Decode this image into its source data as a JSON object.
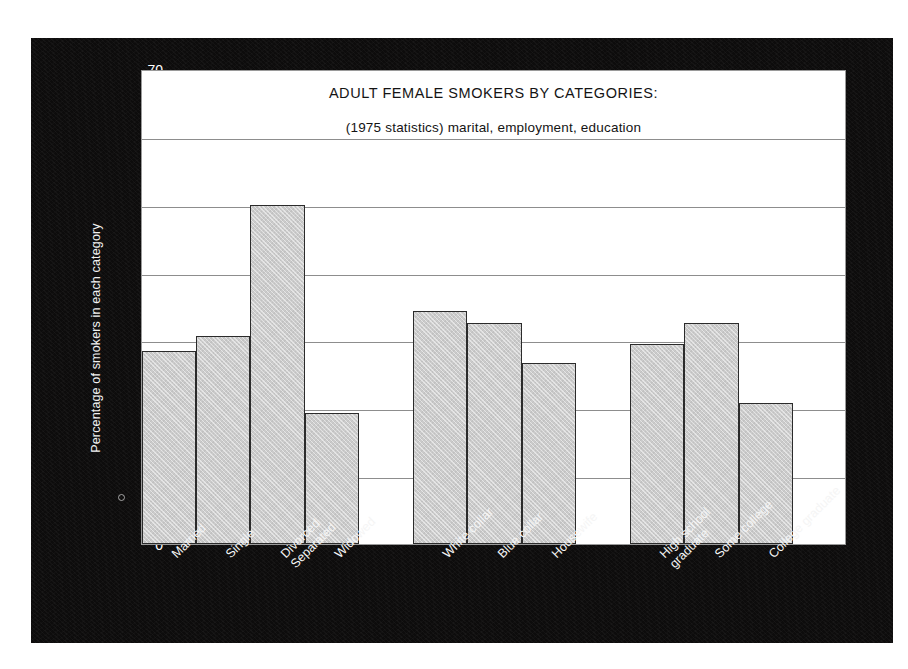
{
  "chart_data": {
    "type": "bar",
    "title": "ADULT FEMALE SMOKERS BY CATEGORIES:",
    "subtitle": "(1975 statistics) marital, employment, education",
    "xlabel": "",
    "ylabel": "Percentage of smokers in each category",
    "ylim": [
      0,
      70
    ],
    "ytick_labels": [
      "70",
      "60",
      "50",
      "40",
      "30",
      "20",
      "10",
      "0"
    ],
    "ytick_values": [
      70,
      60,
      50,
      40,
      30,
      20,
      10,
      0
    ],
    "grid": true,
    "legend": "none",
    "categories": [
      "Married",
      "Single",
      "Divorced Separated",
      "Widowed",
      "White collar",
      "Blue collar",
      "Housewife",
      "High school graduate",
      "Some college",
      "College graduate"
    ],
    "values": [
      28.5,
      30.7,
      50.0,
      19.3,
      34.4,
      32.5,
      26.7,
      29.5,
      32.5,
      20.8
    ],
    "groups": [
      {
        "name": "marital",
        "categories": [
          "Married",
          "Single",
          "Divorced Separated",
          "Widowed"
        ]
      },
      {
        "name": "employment",
        "categories": [
          "White collar",
          "Blue collar",
          "Housewife"
        ]
      },
      {
        "name": "education",
        "categories": [
          "High school graduate",
          "Some college",
          "College graduate"
        ]
      }
    ],
    "bars": [
      {
        "label_lines": [
          "Married"
        ],
        "value": 28.5,
        "group": "marital",
        "slot": 1
      },
      {
        "label_lines": [
          "Single"
        ],
        "value": 30.7,
        "group": "marital",
        "slot": 2
      },
      {
        "label_lines": [
          "Divorced",
          "Separated"
        ],
        "value": 50.0,
        "group": "marital",
        "slot": 3
      },
      {
        "label_lines": [
          "Widowed"
        ],
        "value": 19.3,
        "group": "marital",
        "slot": 4
      },
      {
        "label_lines": [
          "White collar"
        ],
        "value": 34.4,
        "group": "employment",
        "slot": 6
      },
      {
        "label_lines": [
          "Blue collar"
        ],
        "value": 32.5,
        "group": "employment",
        "slot": 7
      },
      {
        "label_lines": [
          "Housewife"
        ],
        "value": 26.7,
        "group": "employment",
        "slot": 8
      },
      {
        "label_lines": [
          "High school",
          "graduate"
        ],
        "value": 29.5,
        "group": "education",
        "slot": 10
      },
      {
        "label_lines": [
          "Some college"
        ],
        "value": 32.5,
        "group": "education",
        "slot": 11
      },
      {
        "label_lines": [
          "College graduate"
        ],
        "value": 20.8,
        "group": "education",
        "slot": 12
      }
    ],
    "colors": {
      "bar_fill": "#cbcbcb",
      "bar_outline": "#2b2b2b",
      "panel_background": "#0d0c0c",
      "plot_background": "#ffffff",
      "gridline": "#8d8d8d",
      "axis_text": "#ffffff",
      "title_text": "#141414"
    }
  }
}
